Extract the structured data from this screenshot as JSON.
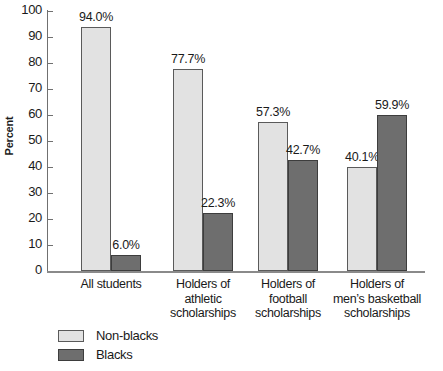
{
  "chart_data": {
    "type": "bar",
    "title": "",
    "xlabel": "",
    "ylabel": "Percent",
    "ylim": [
      0,
      100
    ],
    "ytick_step": 10,
    "yticks": [
      "100",
      "90",
      "80",
      "70",
      "60",
      "50",
      "40",
      "30",
      "20",
      "10",
      "0"
    ],
    "grid": false,
    "legend_position": "bottom-left",
    "categories": [
      "All students",
      "Holders of athletic scholarships",
      "Holders of football scholarships",
      "Holders of men’s basketball scholarships"
    ],
    "category_lines": [
      [
        "All students"
      ],
      [
        "Holders of",
        "athletic",
        "scholarships"
      ],
      [
        "Holders of",
        "football",
        "scholarships"
      ],
      [
        "Holders of",
        "men’s basketball",
        "scholarships"
      ]
    ],
    "series": [
      {
        "name": "Non-blacks",
        "color": "#e2e2e2",
        "values": [
          94.0,
          77.7,
          57.3,
          40.1
        ],
        "labels": [
          "94.0%",
          "77.7%",
          "57.3%",
          "40.1%"
        ]
      },
      {
        "name": "Blacks",
        "color": "#6e6e6e",
        "values": [
          6.0,
          22.3,
          42.7,
          59.9
        ],
        "labels": [
          "6.0%",
          "22.3%",
          "42.7%",
          "59.9%"
        ]
      }
    ]
  },
  "legend": {
    "items": [
      {
        "label": "Non-blacks",
        "swatch": "light"
      },
      {
        "label": "Blacks",
        "swatch": "dark"
      }
    ]
  }
}
